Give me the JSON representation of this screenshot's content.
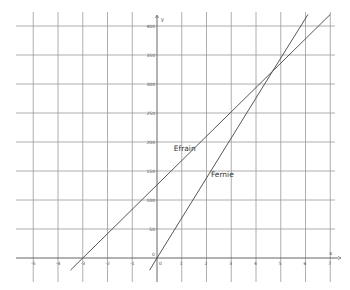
{
  "chart_data": {
    "type": "line",
    "title": "",
    "xlabel": "x",
    "ylabel": "y",
    "xlim": [
      -5,
      7
    ],
    "ylim": [
      0,
      400
    ],
    "grid": true,
    "x_ticks": [
      -5,
      -4,
      -3,
      -2,
      -1,
      0,
      1,
      2,
      3,
      4,
      5,
      6,
      7
    ],
    "y_ticks": [
      50,
      100,
      150,
      200,
      250,
      300,
      350,
      400
    ],
    "series": [
      {
        "name": "Efrain",
        "points": [
          [
            -3.5,
            -21
          ],
          [
            -3,
            0
          ],
          [
            0,
            126
          ],
          [
            4.67,
            322
          ],
          [
            7,
            420
          ]
        ]
      },
      {
        "name": "Fernie",
        "points": [
          [
            -0.3,
            -21
          ],
          [
            0,
            0
          ],
          [
            4.67,
            322
          ],
          [
            6.1,
            420
          ]
        ]
      }
    ],
    "annotations": [
      {
        "text": "Efrain",
        "x": 1.0,
        "y": 205
      },
      {
        "text": "Fernie",
        "x": 2.5,
        "y": 160
      }
    ]
  }
}
